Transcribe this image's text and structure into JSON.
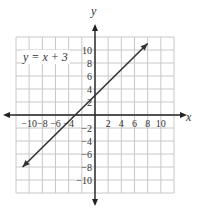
{
  "chart_data": {
    "type": "line",
    "title": "",
    "equation": "y =  x + 3",
    "xlabel": "x",
    "ylabel": "y",
    "xlim": [
      -12,
      12
    ],
    "ylim": [
      -12,
      12
    ],
    "grid": true,
    "grid_step": 2,
    "x_ticks": [
      -10,
      -8,
      -6,
      -4,
      2,
      4,
      6,
      8,
      10
    ],
    "x_tick_labels": [
      "−10",
      "−8",
      "−6",
      "−4",
      "2",
      "4",
      "6",
      "8",
      "10"
    ],
    "y_ticks": [
      10,
      8,
      6,
      4,
      2,
      -2,
      -4,
      -6,
      -8,
      -10
    ],
    "y_tick_labels": [
      "10",
      "8",
      "6",
      "4",
      "2",
      "−2",
      "−4",
      "−6",
      "−8",
      "−10"
    ],
    "series": [
      {
        "name": "y = x + 3",
        "slope": 1,
        "intercept": 3,
        "x": [
          -11,
          8
        ],
        "y": [
          -8,
          11
        ],
        "arrows": "both"
      }
    ],
    "colors": {
      "line": "#333333",
      "grid": "#c8c8c8",
      "axis": "#222222"
    }
  }
}
